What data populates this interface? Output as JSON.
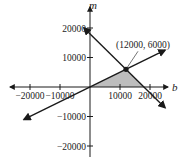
{
  "chart_data": {
    "type": "line",
    "title": "",
    "xlabel": "b",
    "ylabel": "m",
    "xlim": [
      -25000,
      25000
    ],
    "ylim": [
      -25000,
      25000
    ],
    "grid": false,
    "x_ticks": [
      -20000,
      -10000,
      10000,
      20000
    ],
    "x_tick_labels": [
      "−20000",
      "−10000",
      "10000",
      "20000"
    ],
    "y_ticks": [
      20000,
      10000,
      -10000,
      -20000
    ],
    "y_tick_labels": [
      "20000",
      "10000",
      "−10000",
      "−20000"
    ],
    "series": [
      {
        "name": "m = b/2",
        "points": [
          [
            -22000,
            -11000
          ],
          [
            25000,
            12500
          ]
        ],
        "arrows": "both"
      },
      {
        "name": "m = 18000 - b",
        "points": [
          [
            -2000,
            20000
          ],
          [
            25000,
            -7000
          ]
        ],
        "arrows": "both"
      }
    ],
    "shaded_region": {
      "vertices": [
        [
          0,
          0
        ],
        [
          12000,
          6000
        ],
        [
          18000,
          0
        ]
      ],
      "color": "#bdbdbd"
    },
    "annotations": [
      {
        "point": [
          12000,
          6000
        ],
        "label": "(12000, 6000)"
      }
    ],
    "colors": {
      "line": "#1a1a1a",
      "axis": "#1a1a1a",
      "fill": "#bdbdbd"
    }
  }
}
